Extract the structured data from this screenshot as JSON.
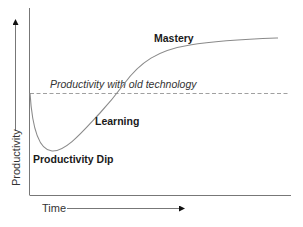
{
  "diagram": {
    "type": "learning-curve",
    "axes": {
      "x_label": "Time",
      "y_label": "Productivity"
    },
    "reference_line": {
      "label": "Productivity with old technology",
      "style": "dashed"
    },
    "phases": [
      {
        "id": "dip",
        "label": "Productivity Dip"
      },
      {
        "id": "learning",
        "label": "Learning"
      },
      {
        "id": "mastery",
        "label": "Mastery"
      }
    ],
    "colors": {
      "curve": "#8a8a8a",
      "axis": "#777777",
      "reference": "#888888",
      "text": "#1a1a1a",
      "arrow": "#111111"
    }
  }
}
